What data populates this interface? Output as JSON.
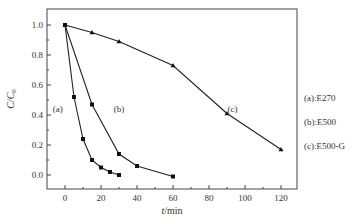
{
  "chart_data": {
    "type": "line",
    "title": "",
    "xlabel": "t/min",
    "ylabel": "C/C0",
    "xlim": [
      -10,
      130
    ],
    "ylim": [
      -0.093,
      1.12
    ],
    "xticks": [
      0,
      20,
      40,
      60,
      80,
      100,
      120
    ],
    "xtick_labels": [
      "0",
      "20",
      "40",
      "60",
      "80",
      "100",
      "120"
    ],
    "yticks": [
      0.0,
      0.2,
      0.4,
      0.6,
      0.8,
      1.0
    ],
    "ytick_labels": [
      "0.0",
      "0.2",
      "0.4",
      "0.6",
      "0.8",
      "1.0"
    ],
    "grid": false,
    "legend_position": "right-outside",
    "legend": [
      "(a):E270",
      "(b):E500",
      "(c):E500-G"
    ],
    "series": [
      {
        "name": "(a):E270",
        "tag": "(a)",
        "marker": "square",
        "x": [
          0,
          5,
          10,
          15,
          20,
          25,
          30
        ],
        "values": [
          1.0,
          0.52,
          0.24,
          0.1,
          0.05,
          0.02,
          0.0
        ],
        "label_pos": [
          -4,
          0.42
        ]
      },
      {
        "name": "(b):E500",
        "tag": "(b)",
        "marker": "square",
        "x": [
          0,
          15,
          30,
          40,
          60
        ],
        "values": [
          1.0,
          0.47,
          0.14,
          0.06,
          -0.01
        ],
        "label_pos": [
          30,
          0.42
        ]
      },
      {
        "name": "(c):E500-G",
        "tag": "(c)",
        "marker": "triangle",
        "x": [
          0,
          15,
          30,
          60,
          90,
          120
        ],
        "values": [
          1.0,
          0.95,
          0.89,
          0.73,
          0.41,
          0.17
        ],
        "label_pos": [
          93,
          0.42
        ]
      }
    ]
  },
  "labels": {
    "xlabel_italic": "t",
    "xlabel_rest": "/min",
    "ylabel_main": "C/C",
    "ylabel_sub": "0"
  }
}
